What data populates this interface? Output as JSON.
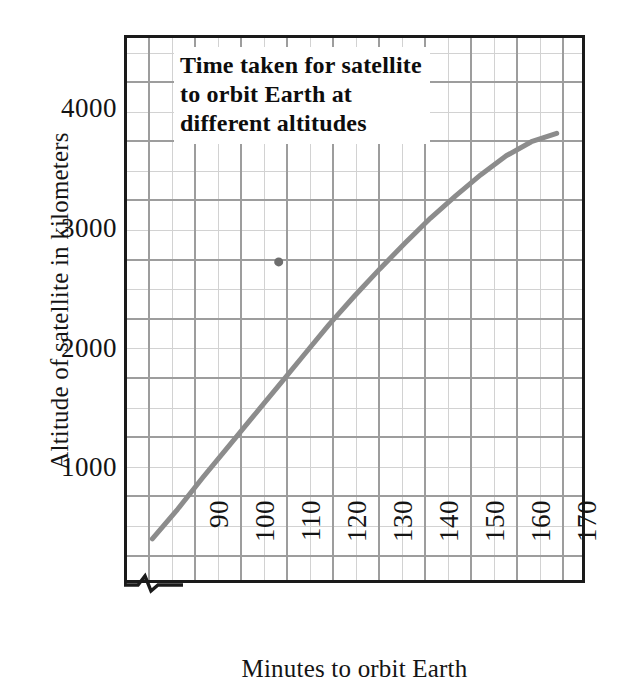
{
  "chart_data": {
    "type": "line",
    "title": "Time taken for satellite\nto orbit Earth at\ndifferent altitudes",
    "xlabel": "Minutes to orbit Earth",
    "ylabel": "Altitude of satellite in kilometers",
    "xlim": [
      85,
      175
    ],
    "ylim": [
      0,
      4600
    ],
    "grid": true,
    "legend": "none",
    "x_major_ticks": [
      90,
      100,
      110,
      120,
      130,
      140,
      150,
      160,
      170
    ],
    "x_tick_labels": [
      "90",
      "100",
      "110",
      "120",
      "130",
      "140",
      "150",
      "160",
      "170"
    ],
    "x_minor_tick_step": 5,
    "y_major_ticks": [
      1000,
      2000,
      3000,
      4000
    ],
    "y_tick_labels": [
      "1000",
      "2000",
      "3000",
      "4000"
    ],
    "y_minor_tick_step": 250,
    "x_axis_has_break": true,
    "series": [
      {
        "name": "Orbital altitude vs period",
        "type": "line",
        "color": "#8c8c8c",
        "line_width": 5,
        "x": [
          90,
          95,
          100,
          105,
          110,
          115,
          120,
          125,
          130,
          135,
          140,
          145,
          150,
          155,
          160,
          165,
          170
        ],
        "values": [
          350,
          600,
          870,
          1130,
          1390,
          1650,
          1910,
          2170,
          2410,
          2640,
          2860,
          3070,
          3260,
          3440,
          3600,
          3720,
          3790
        ]
      },
      {
        "name": "Isolated data point",
        "type": "scatter",
        "color": "#6e6e6e",
        "marker_size": 9,
        "x": [
          115
        ],
        "values": [
          2700
        ]
      }
    ]
  },
  "axis": {
    "y_title": "Altitude of satellite in kilometers",
    "x_title": "Minutes to orbit Earth",
    "y_labels": [
      "4000",
      "3000",
      "2000",
      "1000"
    ],
    "x_labels": [
      "90",
      "100",
      "110",
      "120",
      "130",
      "140",
      "150",
      "160",
      "170"
    ]
  },
  "title_block": {
    "line1": "Time taken for satellite",
    "line2": "to orbit Earth at",
    "line3": "different altitudes",
    "full": "Time taken for satellite\nto orbit Earth at\ndifferent altitudes"
  },
  "colors": {
    "frame": "#1a1a1a",
    "grid_major": "#9a9a9a",
    "grid_minor": "#cccccc",
    "data_line": "#8c8c8c",
    "point": "#6e6e6e",
    "background": "#ffffff",
    "text": "#141414"
  }
}
